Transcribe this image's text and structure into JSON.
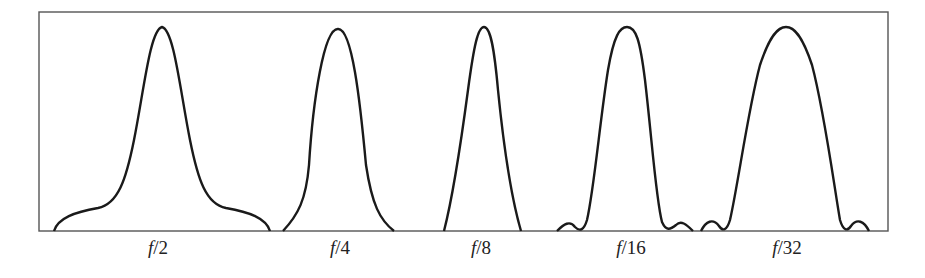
{
  "figure": {
    "frame": {
      "left": 39,
      "top": 12,
      "right": 888,
      "bottom": 231,
      "stroke": "#555555"
    },
    "curve_color": "#1a1a1a",
    "panels": [
      {
        "id": "f2",
        "label_prefix": "f",
        "label_suffix": "/2",
        "label_x": 158,
        "path": "M54,231 C58,218 75,212 98,208 C118,204 126,180 134,140 C144,90 150,30 162,27 C174,30 180,90 190,140 C198,180 206,204 226,208 C249,212 266,218 270,231"
      },
      {
        "id": "f4",
        "label_prefix": "f",
        "label_suffix": "/4",
        "label_x": 340,
        "path": "M283,231 C298,215 306,200 309,165 C313,100 324,28 338,29 C352,28 360,100 366,165 C372,205 380,220 394,231"
      },
      {
        "id": "f8",
        "label_prefix": "f",
        "label_suffix": "/8",
        "label_x": 481,
        "path": "M444,231 C452,200 460,150 468,90 C474,45 478,27 484,27 C490,27 494,45 498,90 C504,150 512,200 521,231"
      },
      {
        "id": "f16",
        "label_prefix": "f",
        "label_suffix": "/16",
        "label_x": 631,
        "path": "M557,231 C564,224 570,220 575,227 C580,232 584,230 587,220 C594,190 600,120 608,70 C614,35 620,27 627,27 C636,27 640,40 645,80 C652,140 656,200 662,222 C666,231 670,230 676,225 C681,220 686,224 693,231 M701,231 C706,221 713,218 719,226 C723,232 727,230 730,220 C738,185 748,110 760,65 C770,35 778,27 786,27 C794,27 802,35 812,65 C824,110 834,185 840,220 C843,230 847,232 851,226 C857,218 864,221 869,231"
      },
      {
        "id": "f32",
        "label_prefix": "f",
        "label_suffix": "/32",
        "label_x": 787,
        "path": ""
      }
    ]
  }
}
